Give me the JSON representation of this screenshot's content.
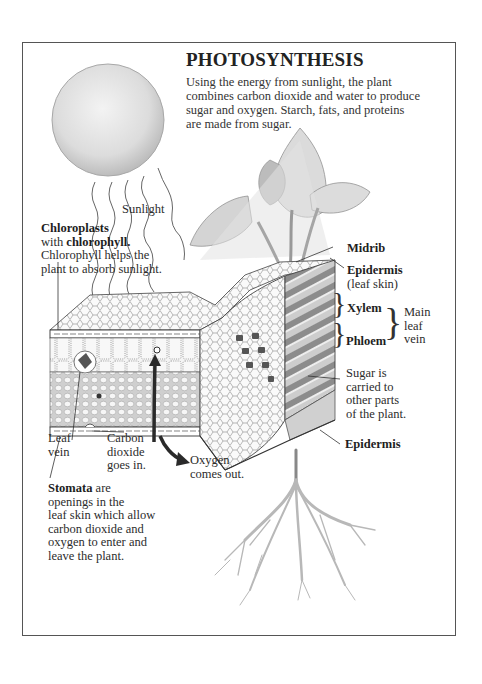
{
  "title": "PHOTOSYNTHESIS",
  "intro": {
    "lines": [
      "Using the energy from sunlight, the plant",
      "combines carbon dioxide and water to produce",
      "sugar and oxygen.  Starch, fats, and proteins",
      "are made from sugar."
    ]
  },
  "labels": {
    "sunlight": "Sunlight",
    "chloroplasts": {
      "heading": "Chloroplasts",
      "with": "with ",
      "chlorophyll": "chlorophyll.",
      "line1": "Chlorophyll helps the",
      "line2": "plant to absorb sunlight."
    },
    "midrib": "Midrib",
    "epidermis_top": {
      "name": "Epidermis",
      "note": "(leaf skin)"
    },
    "xylem": "Xylem",
    "phloem": "Phloem",
    "main_leaf_vein": [
      "Main",
      "leaf",
      "vein"
    ],
    "sugar": [
      "Sugar is",
      "carried to",
      "other parts",
      "of the plant."
    ],
    "epidermis_bottom": "Epidermis",
    "leaf_vein": [
      "Leaf",
      "vein"
    ],
    "carbon_dioxide": [
      "Carbon",
      "dioxide",
      "goes in."
    ],
    "oxygen": [
      "Oxygen",
      "comes out."
    ],
    "stomata": {
      "heading": "Stomata",
      "rest": " are",
      "lines": [
        "openings in the",
        "leaf skin which allow",
        "carbon dioxide and",
        "oxygen to enter and",
        "leave the plant."
      ]
    }
  },
  "illustration": {
    "elements": [
      "sun",
      "sunlight-rays",
      "plant-leaves",
      "leaf-cross-section",
      "roots"
    ],
    "colors": {
      "ink": "#2a2a2a",
      "shade": "#bdbdbd",
      "light": "#e6e6e6",
      "frame": "#555555"
    }
  }
}
